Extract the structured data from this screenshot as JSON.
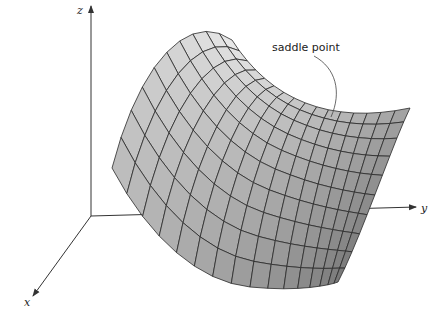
{
  "figure": {
    "type": "3d-surface-diagram"
  },
  "axes": {
    "x": {
      "label": "x"
    },
    "y": {
      "label": "y"
    },
    "z": {
      "label": "z"
    }
  },
  "annotation": {
    "text": "saddle point"
  },
  "surface": {
    "shape": "saddle",
    "grid_u": 16,
    "grid_v": 10,
    "colors": {
      "light": "#f2f2f2",
      "dark": "#6e6e6e",
      "edge": "#2a2a2a"
    }
  },
  "colors": {
    "axis": "#333333",
    "background": "#ffffff"
  }
}
